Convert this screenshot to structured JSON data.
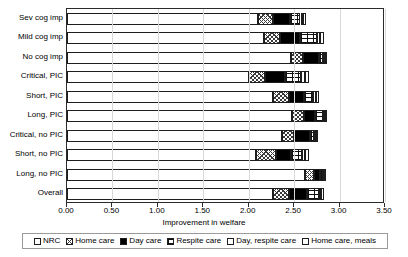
{
  "chart_data": {
    "type": "bar",
    "orientation": "horizontal",
    "stacked": true,
    "title": "",
    "xlabel": "Improvement in welfare",
    "ylabel": "",
    "xlim": [
      0.0,
      3.5
    ],
    "xticks": [
      "0.00",
      "0.50",
      "1.00",
      "1.50",
      "2.00",
      "2.50",
      "3.00",
      "3.50"
    ],
    "xtick_values": [
      0.0,
      0.5,
      1.0,
      1.5,
      2.0,
      2.5,
      3.0,
      3.5
    ],
    "grid": false,
    "legend_position": "bottom",
    "categories": [
      "Sev cog imp",
      "Mild cog imp",
      "No cog imp",
      "Critical, PIC",
      "Short, PIC",
      "Long, PIC",
      "Critical, no PIC",
      "Short, no PIC",
      "Long, no PIC",
      "Overall"
    ],
    "series": [
      {
        "name": "NRC",
        "pattern": "fine-dotted",
        "values": [
          2.1,
          2.17,
          2.47,
          2.0,
          2.27,
          2.48,
          2.37,
          2.08,
          2.62,
          2.27
        ]
      },
      {
        "name": "Home care",
        "pattern": "cross-hatch",
        "values": [
          0.17,
          0.17,
          0.13,
          0.18,
          0.17,
          0.13,
          0.13,
          0.22,
          0.1,
          0.17
        ]
      },
      {
        "name": "Day care",
        "pattern": "solid-black",
        "values": [
          0.18,
          0.22,
          0.17,
          0.22,
          0.17,
          0.12,
          0.17,
          0.17,
          0.07,
          0.2
        ]
      },
      {
        "name": "Respite care",
        "pattern": "dashed-grid",
        "values": [
          0.12,
          0.19,
          0.05,
          0.18,
          0.1,
          0.09,
          0.05,
          0.12,
          0.03,
          0.13
        ]
      },
      {
        "name": "Day, respite care",
        "pattern": "white",
        "values": [
          0.03,
          0.04,
          0.02,
          0.04,
          0.03,
          0.02,
          0.02,
          0.03,
          0.01,
          0.03
        ]
      },
      {
        "name": "Home care, meals",
        "pattern": "white",
        "values": [
          0.03,
          0.04,
          0.02,
          0.04,
          0.03,
          0.02,
          0.02,
          0.04,
          0.01,
          0.03
        ]
      }
    ],
    "totals": [
      2.63,
      2.83,
      2.86,
      2.66,
      2.77,
      2.86,
      2.76,
      2.66,
      2.84,
      2.83
    ]
  },
  "legend": {
    "items": [
      {
        "label": "NRC"
      },
      {
        "label": "Home care"
      },
      {
        "label": "Day care"
      },
      {
        "label": "Respite care"
      },
      {
        "label": "Day, respite care"
      },
      {
        "label": "Home care, meals"
      }
    ]
  }
}
